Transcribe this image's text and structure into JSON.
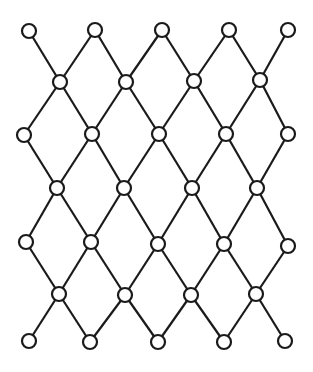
{
  "diagram": {
    "type": "lattice",
    "stroke_color": "#1a1a1a",
    "node_fill": "#ffffff",
    "nodes": [
      {
        "id": "r0c0",
        "x": 29,
        "y": 31
      },
      {
        "id": "r0c1",
        "x": 95,
        "y": 30
      },
      {
        "id": "r0c2",
        "x": 162,
        "y": 30
      },
      {
        "id": "r0c3",
        "x": 229,
        "y": 30
      },
      {
        "id": "r0c4",
        "x": 288,
        "y": 30
      },
      {
        "id": "r1c0",
        "x": 60,
        "y": 82
      },
      {
        "id": "r1c1",
        "x": 126,
        "y": 82
      },
      {
        "id": "r1c2",
        "x": 194,
        "y": 81
      },
      {
        "id": "r1c3",
        "x": 260,
        "y": 80
      },
      {
        "id": "r2c0",
        "x": 24,
        "y": 135
      },
      {
        "id": "r2c1",
        "x": 92,
        "y": 134
      },
      {
        "id": "r2c2",
        "x": 159,
        "y": 134
      },
      {
        "id": "r2c3",
        "x": 226,
        "y": 134
      },
      {
        "id": "r2c4",
        "x": 288,
        "y": 134
      },
      {
        "id": "r3c0",
        "x": 57,
        "y": 188
      },
      {
        "id": "r3c1",
        "x": 124,
        "y": 188
      },
      {
        "id": "r3c2",
        "x": 192,
        "y": 188
      },
      {
        "id": "r3c3",
        "x": 257,
        "y": 188
      },
      {
        "id": "r4c0",
        "x": 26,
        "y": 242
      },
      {
        "id": "r4c1",
        "x": 91,
        "y": 242
      },
      {
        "id": "r4c2",
        "x": 158,
        "y": 244
      },
      {
        "id": "r4c3",
        "x": 224,
        "y": 244
      },
      {
        "id": "r4c4",
        "x": 288,
        "y": 246
      },
      {
        "id": "r5c0",
        "x": 59,
        "y": 294
      },
      {
        "id": "r5c1",
        "x": 125,
        "y": 295
      },
      {
        "id": "r5c2",
        "x": 191,
        "y": 295
      },
      {
        "id": "r5c3",
        "x": 256,
        "y": 294
      },
      {
        "id": "r6c0",
        "x": 29,
        "y": 341
      },
      {
        "id": "r6c1",
        "x": 90,
        "y": 342
      },
      {
        "id": "r6c2",
        "x": 158,
        "y": 342
      },
      {
        "id": "r6c3",
        "x": 224,
        "y": 342
      },
      {
        "id": "r6c4",
        "x": 285,
        "y": 341
      }
    ]
  }
}
